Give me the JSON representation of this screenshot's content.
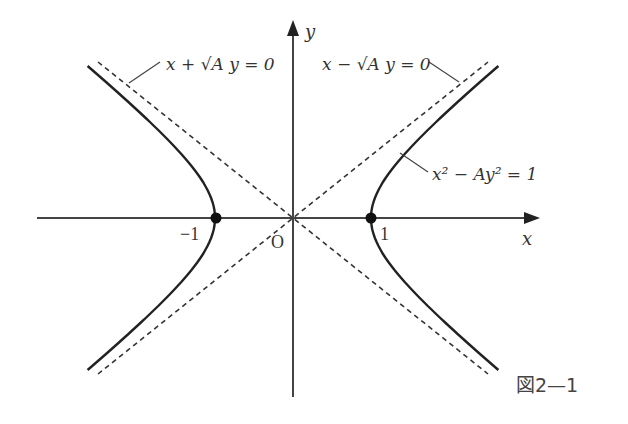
{
  "figure": {
    "caption": "図2—1",
    "axes": {
      "x_label": "x",
      "y_label": "y",
      "origin_label": "O",
      "tick_neg": "−1",
      "tick_pos": "1"
    },
    "labels": {
      "asymptote_left": "x + √A y = 0",
      "asymptote_right": "x − √A y = 0",
      "curve": "x² − Ay² = 1"
    },
    "colors": {
      "curve": "#222222",
      "axis": "#444444",
      "asymptote": "#333333"
    }
  },
  "chart_data": {
    "type": "diagram",
    "curve": {
      "equation": "x^2 - A y^2 = 1",
      "vertices": [
        [
          -1,
          0
        ],
        [
          1,
          0
        ]
      ]
    },
    "asymptotes": [
      "x + sqrt(A) y = 0",
      "x - sqrt(A) y = 0"
    ],
    "marked_points": [
      [
        -1,
        0
      ],
      [
        1,
        0
      ]
    ],
    "xlabel": "x",
    "ylabel": "y"
  }
}
